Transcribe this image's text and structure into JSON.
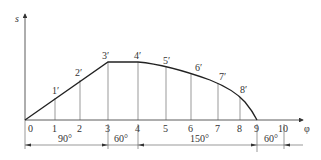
{
  "axes": {
    "y_label": "s",
    "x_label": "φ"
  },
  "ticks": [
    "0",
    "1",
    "2",
    "3",
    "4",
    "5",
    "6",
    "7",
    "8",
    "9",
    "10"
  ],
  "points": [
    {
      "label": "1′"
    },
    {
      "label": "2′"
    },
    {
      "label": "3′"
    },
    {
      "label": "4′"
    },
    {
      "label": "5′"
    },
    {
      "label": "6′"
    },
    {
      "label": "7′"
    },
    {
      "label": "8′"
    }
  ],
  "segments": [
    {
      "label": "90°"
    },
    {
      "label": "60°"
    },
    {
      "label": "150°"
    },
    {
      "label": "60°"
    }
  ],
  "colors": {
    "line": "#333333",
    "curve": "#222222",
    "text": "#333333"
  }
}
